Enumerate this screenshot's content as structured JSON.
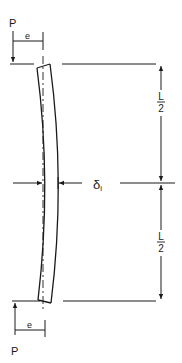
{
  "diagram": {
    "colors": {
      "ink": "#1a1a1a",
      "background": "#ffffff"
    },
    "labels": {
      "load_top": "P",
      "load_bottom": "P",
      "eccentricity_top": "e",
      "eccentricity_bottom": "e",
      "deflection": "δ",
      "deflection_subscript": "i",
      "half_length_top_num": "L",
      "half_length_top_den": "2",
      "half_length_bottom_num": "L",
      "half_length_bottom_den": "2"
    }
  }
}
